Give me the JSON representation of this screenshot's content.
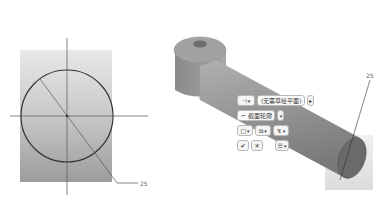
{
  "left_view": {
    "callout_label": "25"
  },
  "right_view": {
    "callout_label": "25",
    "dashboard": {
      "row1": {
        "button_icon": "sketch-plane-icon",
        "field_text": "(无需草绘平面)",
        "next_arrow": "▸"
      },
      "row2": {
        "button_icon": "section-icon",
        "field_text": "截面轮廓"
      },
      "row3": {
        "buttons": [
          "□",
          "⧉",
          "↯"
        ]
      },
      "row4": {
        "ok_label": "✔",
        "cancel_label": "✕",
        "options_label": "☰"
      },
      "dropdown_arrow": "▾"
    }
  },
  "colors": {
    "rect_gradient_top": "#e6e6e6",
    "rect_gradient_bottom": "#9a9a9a",
    "part_gray": "#8c8c8c",
    "line_dark": "#333333"
  }
}
